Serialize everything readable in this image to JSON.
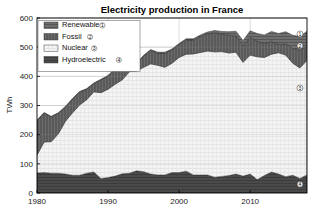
{
  "chart_data": {
    "type": "area",
    "title": "Electricity production in France",
    "xlabel": "",
    "ylabel": "TWh",
    "xlim": [
      1980,
      2018
    ],
    "ylim": [
      0,
      600
    ],
    "xticks": [
      1980,
      1990,
      2000,
      2010
    ],
    "yticks": [
      0,
      100,
      200,
      300,
      400,
      500,
      600
    ],
    "grid": true,
    "stacked": true,
    "legend_position": "top-left",
    "x": [
      1980,
      1981,
      1982,
      1983,
      1984,
      1985,
      1986,
      1987,
      1988,
      1989,
      1990,
      1991,
      1992,
      1993,
      1994,
      1995,
      1996,
      1997,
      1998,
      1999,
      2000,
      2001,
      2002,
      2003,
      2004,
      2005,
      2006,
      2007,
      2008,
      2009,
      2010,
      2011,
      2012,
      2013,
      2014,
      2015,
      2016,
      2017,
      2018
    ],
    "series": [
      {
        "name": "Hydroelectric",
        "marker": "4",
        "color": "#4a4a4a",
        "values": [
          69,
          70,
          68,
          68,
          65,
          61,
          61,
          68,
          72,
          50,
          53,
          58,
          66,
          68,
          76,
          73,
          65,
          62,
          62,
          70,
          70,
          75,
          62,
          62,
          62,
          54,
          57,
          60,
          65,
          58,
          65,
          46,
          60,
          72,
          65,
          56,
          61,
          50,
          62
        ]
      },
      {
        "name": "Nuclear",
        "marker": "3",
        "color": "#f3f3f3",
        "values": [
          61,
          105,
          108,
          135,
          181,
          214,
          241,
          252,
          275,
          294,
          303,
          315,
          322,
          348,
          342,
          358,
          378,
          376,
          369,
          375,
          395,
          401,
          415,
          420,
          425,
          430,
          428,
          420,
          418,
          390,
          408,
          421,
          405,
          404,
          416,
          417,
          384,
          379,
          393
        ]
      },
      {
        "name": "Fossil",
        "marker": "2",
        "color": "#5a5a5a",
        "values": [
          118,
          99,
          85,
          70,
          49,
          47,
          44,
          36,
          28,
          44,
          45,
          53,
          41,
          31,
          25,
          38,
          46,
          42,
          49,
          46,
          45,
          49,
          48,
          55,
          59,
          66,
          60,
          61,
          56,
          56,
          60,
          54,
          47,
          44,
          28,
          38,
          51,
          60,
          48
        ]
      },
      {
        "name": "Renewable",
        "marker": "1",
        "color": "#6e6e6e",
        "values": [
          2,
          2,
          2,
          2,
          2,
          2,
          2,
          2,
          2,
          2,
          2,
          2,
          2,
          2,
          2,
          3,
          3,
          3,
          3,
          3,
          3,
          4,
          4,
          5,
          6,
          7,
          9,
          12,
          16,
          19,
          23,
          26,
          30,
          34,
          38,
          42,
          45,
          48,
          52
        ]
      }
    ],
    "legend": [
      {
        "label": "Renewable",
        "num": "1"
      },
      {
        "label": "Fossil",
        "num": "2"
      },
      {
        "label": "Nuclear",
        "num": "3"
      },
      {
        "label": "Hydroelectric",
        "num": "4"
      }
    ],
    "callouts": [
      {
        "num": "1",
        "y_value": 545
      },
      {
        "num": "2",
        "y_value": 505
      },
      {
        "num": "3",
        "y_value": 360
      },
      {
        "num": "4",
        "y_value": 30
      }
    ]
  },
  "colors": {
    "plot_background": "#ffffff",
    "axis": "#000000",
    "grid": "#c8c8c8",
    "text": "#111111"
  }
}
